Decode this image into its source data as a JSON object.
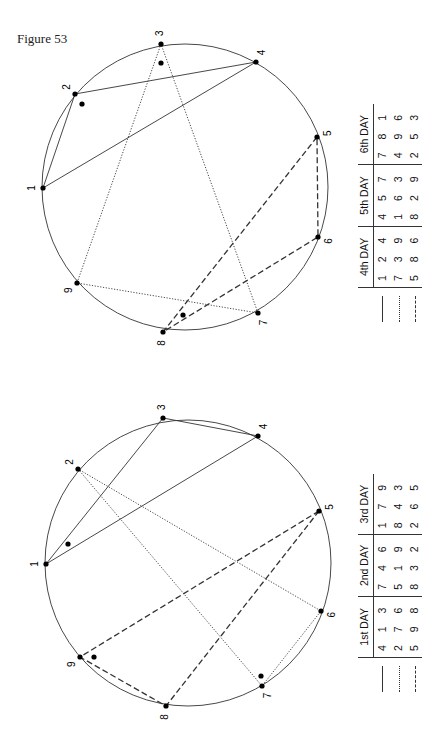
{
  "figure_label": "Figure 53",
  "diagrams": [
    {
      "id": "top",
      "points": [
        {
          "label": "1",
          "x": 43,
          "y": 188
        },
        {
          "label": "2",
          "x": 75,
          "y": 94
        },
        {
          "label": "3",
          "x": 161,
          "y": 44
        },
        {
          "label": "4",
          "x": 256,
          "y": 62
        },
        {
          "label": "5",
          "x": 317,
          "y": 137
        },
        {
          "label": "6",
          "x": 318,
          "y": 237
        },
        {
          "label": "7",
          "x": 258,
          "y": 313
        },
        {
          "label": "8",
          "x": 163,
          "y": 332
        },
        {
          "label": "9",
          "x": 77,
          "y": 283
        }
      ],
      "center": {
        "x": 185,
        "y": 187
      },
      "radius": 143,
      "triangles": [
        {
          "style": "solid",
          "vertices": [
            "1",
            "2",
            "4"
          ]
        },
        {
          "style": "dotted",
          "vertices": [
            "7",
            "3",
            "9"
          ]
        },
        {
          "style": "dashed",
          "vertices": [
            "5",
            "8",
            "6"
          ]
        }
      ],
      "extra_dots": [
        {
          "x": 161,
          "y": 63
        },
        {
          "x": 82,
          "y": 104
        },
        {
          "x": 183,
          "y": 315
        }
      ],
      "table": {
        "headers": [
          "4th DAY",
          "5th DAY",
          "6th DAY"
        ],
        "rows": [
          {
            "style": "solid",
            "cells": [
              "1 2 4",
              "4 5 7",
              "7 8 1"
            ]
          },
          {
            "style": "dotted",
            "cells": [
              "7 3 9",
              "1 6 3",
              "4 9 6"
            ]
          },
          {
            "style": "dashed",
            "cells": [
              "5 8 6",
              "8 2 9",
              "2 5 3"
            ]
          }
        ]
      }
    },
    {
      "id": "bottom",
      "points": [
        {
          "label": "1",
          "x": 46,
          "y": 564
        },
        {
          "label": "2",
          "x": 78,
          "y": 469
        },
        {
          "label": "3",
          "x": 163,
          "y": 418
        },
        {
          "label": "4",
          "x": 258,
          "y": 436
        },
        {
          "label": "5",
          "x": 319,
          "y": 511
        },
        {
          "label": "6",
          "x": 321,
          "y": 611
        },
        {
          "label": "7",
          "x": 262,
          "y": 686
        },
        {
          "label": "8",
          "x": 166,
          "y": 706
        },
        {
          "label": "9",
          "x": 80,
          "y": 657
        }
      ],
      "center": {
        "x": 188,
        "y": 563
      },
      "radius": 143,
      "triangles": [
        {
          "style": "solid",
          "vertices": [
            "4",
            "1",
            "3"
          ]
        },
        {
          "style": "dotted",
          "vertices": [
            "2",
            "7",
            "6"
          ]
        },
        {
          "style": "dashed",
          "vertices": [
            "5",
            "9",
            "8"
          ]
        }
      ],
      "extra_dots": [
        {
          "x": 68,
          "y": 544
        },
        {
          "x": 94,
          "y": 657
        },
        {
          "x": 261,
          "y": 676
        }
      ],
      "table": {
        "headers": [
          "1st DAY",
          "2nd DAY",
          "3rd DAY"
        ],
        "rows": [
          {
            "style": "solid",
            "cells": [
              "4 1 3",
              "7 4 6",
              "1 7 9"
            ]
          },
          {
            "style": "dotted",
            "cells": [
              "2 7 6",
              "5 1 9",
              "8 4 3"
            ]
          },
          {
            "style": "dashed",
            "cells": [
              "5 9 8",
              "8 3 2",
              "2 6 5"
            ]
          }
        ]
      }
    }
  ],
  "colors": {
    "line": "#333333",
    "dot": "#000000"
  }
}
